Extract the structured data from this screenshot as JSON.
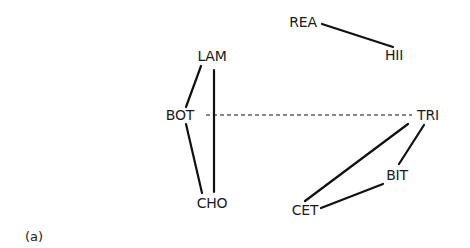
{
  "diagram": {
    "caption": "(a)",
    "nodes": [
      {
        "id": "REA",
        "label": "REA",
        "x": 303,
        "y": 22
      },
      {
        "id": "HII",
        "label": "HII",
        "x": 394,
        "y": 55
      },
      {
        "id": "LAM",
        "label": "LAM",
        "x": 212,
        "y": 56
      },
      {
        "id": "BOT",
        "label": "BOT",
        "x": 180,
        "y": 115
      },
      {
        "id": "TRI",
        "label": "TRI",
        "x": 428,
        "y": 115
      },
      {
        "id": "CHO",
        "label": "CHO",
        "x": 212,
        "y": 203
      },
      {
        "id": "BIT",
        "label": "BIT",
        "x": 397,
        "y": 175
      },
      {
        "id": "CET",
        "label": "CET",
        "x": 305,
        "y": 210
      }
    ],
    "edges": [
      {
        "from": "REA",
        "to": "HII",
        "style": "solid"
      },
      {
        "from": "LAM",
        "to": "BOT",
        "style": "solid"
      },
      {
        "from": "LAM",
        "to": "CHO",
        "style": "solid"
      },
      {
        "from": "BOT",
        "to": "CHO",
        "style": "solid"
      },
      {
        "from": "BOT",
        "to": "TRI",
        "style": "dashed"
      },
      {
        "from": "TRI",
        "to": "CET",
        "style": "solid"
      },
      {
        "from": "TRI",
        "to": "BIT",
        "style": "solid"
      },
      {
        "from": "BIT",
        "to": "CET",
        "style": "solid"
      }
    ],
    "colors": {
      "line": "#111111",
      "text": "#1a1a1a",
      "background": "#ffffff"
    }
  }
}
